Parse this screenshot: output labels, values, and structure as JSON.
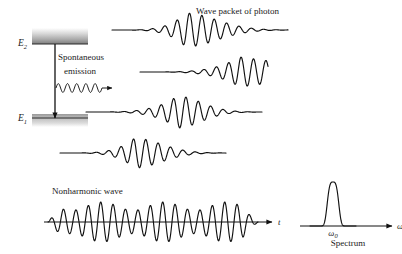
{
  "figure": {
    "width": 402,
    "height": 254,
    "background": "#ffffff",
    "ink_color": "#111111"
  },
  "energy_diagram": {
    "upper_level_label": "E",
    "upper_level_sub": "2",
    "lower_level_label": "E",
    "lower_level_sub": "1",
    "process_label_line1": "Spontaneous",
    "process_label_line2": "emission",
    "upper_band": {
      "x": 32,
      "y": 28,
      "width": 56,
      "height": 16,
      "y_line": 44
    },
    "lower_band": {
      "x": 32,
      "y": 114,
      "width": 56,
      "height": 13,
      "y_line": 118
    },
    "transition_arrow": {
      "x": 55,
      "y_start": 44,
      "y_end": 118
    },
    "photon_arrow": {
      "x_start": 56,
      "x_end": 112,
      "y": 88,
      "cycles": 5,
      "amplitude": 4.4
    }
  },
  "wave_packets": {
    "title": "Wave packet of photon",
    "title_x": 196,
    "title_y": 14,
    "stroke_width": 1.15,
    "packets": [
      {
        "name": "packet-1",
        "x_start": 112,
        "x_end": 288,
        "baseline": 30,
        "amplitude": 17,
        "wavelength": 12.4,
        "envelope": "rise-fall",
        "peak_fraction": 0.42,
        "rise_sharpness": 4.2,
        "decay_sharpness": 2.6,
        "phase": 0.0
      },
      {
        "name": "packet-2",
        "x_start": 140,
        "x_end": 268,
        "baseline": 72,
        "amplitude": 15,
        "wavelength": 12.4,
        "envelope": "rise-clip",
        "peak_fraction": 0.78,
        "rise_sharpness": 4.0,
        "decay_sharpness": 1.4,
        "phase": 0.6
      },
      {
        "name": "packet-3",
        "x_start": 86,
        "x_end": 262,
        "baseline": 112,
        "amplitude": 16,
        "wavelength": 12.4,
        "envelope": "rise-fall",
        "peak_fraction": 0.52,
        "rise_sharpness": 4.0,
        "decay_sharpness": 3.0,
        "phase": 1.2
      },
      {
        "name": "packet-4",
        "x_start": 60,
        "x_end": 226,
        "baseline": 153,
        "amplitude": 15,
        "wavelength": 12.4,
        "envelope": "rise-fall",
        "peak_fraction": 0.45,
        "rise_sharpness": 4.2,
        "decay_sharpness": 2.8,
        "phase": 2.1
      }
    ]
  },
  "nonharmonic_wave": {
    "title": "Nonharmonic wave",
    "title_x": 52,
    "title_y": 194,
    "axis_label": "t",
    "axis": {
      "x_start": 44,
      "x_end": 272,
      "y": 222,
      "arrow_size": 5
    },
    "wave": {
      "x_start": 48,
      "x_end": 258,
      "baseline": 222,
      "amplitude": 20,
      "wavelength": 12.4,
      "beat_wavelength": 62,
      "beat_depth": 0.42,
      "beat_phase": 0.4
    }
  },
  "spectrum": {
    "caption": "Spectrum",
    "caption_x": 348,
    "caption_y": 246,
    "axis_label": "omega",
    "axis_label_glyph": "ω",
    "center_label_glyph": "ω",
    "center_label_sub": "0",
    "axis": {
      "x_start": 300,
      "x_end": 392,
      "y": 226,
      "arrow_size": 5
    },
    "peak": {
      "center_x": 333,
      "center_label_y": 236,
      "height": 44,
      "half_width": 6.5,
      "shoulder": 2.4
    }
  }
}
